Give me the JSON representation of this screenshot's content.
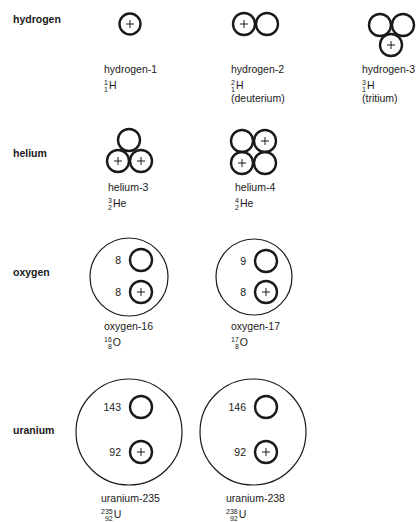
{
  "rows": [
    {
      "element": "hydrogen",
      "isotopes": [
        {
          "name": "hydrogen-1",
          "mass": "1",
          "atomic": "1",
          "symbol": "H",
          "note": ""
        },
        {
          "name": "hydrogen-2",
          "mass": "2",
          "atomic": "1",
          "symbol": "H",
          "note": "(deuterium)"
        },
        {
          "name": "hydrogen-3",
          "mass": "3",
          "atomic": "1",
          "symbol": "H",
          "note": "(tritium)"
        }
      ]
    },
    {
      "element": "helium",
      "isotopes": [
        {
          "name": "helium-3",
          "mass": "3",
          "atomic": "2",
          "symbol": "He"
        },
        {
          "name": "helium-4",
          "mass": "4",
          "atomic": "2",
          "symbol": "He"
        }
      ]
    },
    {
      "element": "oxygen",
      "isotopes": [
        {
          "name": "oxygen-16",
          "mass": "16",
          "atomic": "8",
          "symbol": "O",
          "neutrons": "8",
          "protons": "8"
        },
        {
          "name": "oxygen-17",
          "mass": "17",
          "atomic": "8",
          "symbol": "O",
          "neutrons": "9",
          "protons": "8"
        }
      ]
    },
    {
      "element": "uranium",
      "isotopes": [
        {
          "name": "uranium-235",
          "mass": "235",
          "atomic": "92",
          "symbol": "U",
          "neutrons": "143",
          "protons": "92"
        },
        {
          "name": "uranium-238",
          "mass": "238",
          "atomic": "92",
          "symbol": "U",
          "neutrons": "146",
          "protons": "92"
        }
      ]
    }
  ],
  "legend": {
    "proton_mark": "+",
    "proton_color": "#1a1a1a",
    "stroke_color": "#1a1a1a"
  }
}
